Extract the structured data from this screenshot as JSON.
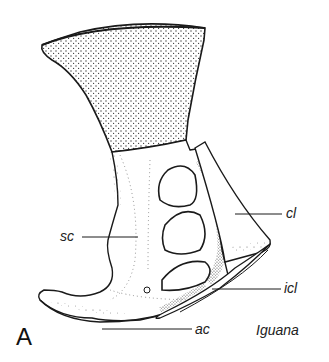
{
  "figure": {
    "panel_letter": "A",
    "taxon": "Iguana",
    "labels": [
      {
        "id": "cl",
        "text": "cl",
        "meaning": "clavicle"
      },
      {
        "id": "sc",
        "text": "sc",
        "meaning": "scapula"
      },
      {
        "id": "icl",
        "text": "icl",
        "meaning": "interclavicle"
      },
      {
        "id": "ac",
        "text": "ac",
        "meaning": "anterior coracoid"
      }
    ],
    "colors": {
      "ink": "#1a1a1a",
      "paper": "#ffffff",
      "stipple": "#3a3a3a"
    }
  }
}
